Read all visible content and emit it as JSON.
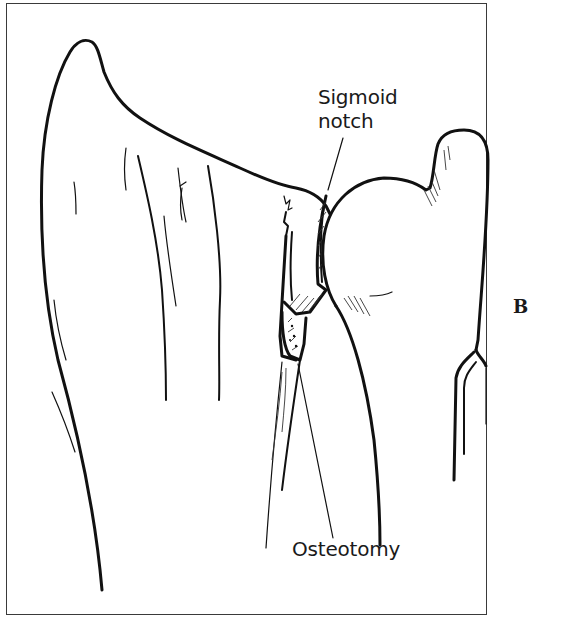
{
  "figure": {
    "panel_label": "B",
    "labels": {
      "sigmoid_notch_line1": "Sigmoid",
      "sigmoid_notch_line2": "notch",
      "osteotomy": "Osteotomy"
    },
    "structures": [
      "distal radius",
      "sigmoid notch",
      "ulnar head",
      "ulnar styloid",
      "osteotomy site",
      "ulnar shaft"
    ],
    "colors": {
      "ink": "#111111",
      "frame": "#3a3a3a",
      "background": "#ffffff"
    }
  }
}
